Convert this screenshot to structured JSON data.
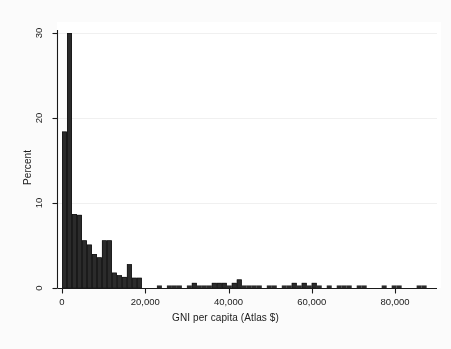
{
  "figure": {
    "background_color": "#fbfbfb",
    "plot_background_color": "#ffffff",
    "axis_color": "#1a1a1a",
    "bar_color": "#2b2b2b",
    "gridline_color": "#f0f0f0"
  },
  "chart_data": {
    "type": "bar",
    "title": "",
    "subtitle": "",
    "xlabel": "GNI per capita (Atlas $)",
    "ylabel": "Percent",
    "xlim": [
      -1500,
      88000
    ],
    "ylim": [
      0,
      30.5
    ],
    "xticks": [
      0,
      20000,
      40000,
      60000,
      80000
    ],
    "xtick_labels": [
      "0",
      "20,000",
      "40,000",
      "60,000",
      "80,000"
    ],
    "yticks": [
      0,
      10,
      20,
      30
    ],
    "ytick_labels": [
      "0",
      "10",
      "20",
      "30"
    ],
    "grid": "horizontal-faint",
    "legend": "none",
    "bin_width": 1200,
    "bin_starts": [
      0,
      1200,
      2400,
      3600,
      4800,
      6000,
      7200,
      8400,
      9600,
      10800,
      12000,
      13200,
      14400,
      15600,
      16800,
      18000,
      19200,
      20400,
      21600,
      22800,
      24000,
      25200,
      26400,
      27600,
      28800,
      30000,
      31200,
      32400,
      33600,
      34800,
      36000,
      37200,
      38400,
      39600,
      40800,
      42000,
      43200,
      44400,
      45600,
      46800,
      48000,
      49200,
      50400,
      51600,
      52800,
      54000,
      55200,
      56400,
      57600,
      58800,
      60000,
      61200,
      62400,
      63600,
      64800,
      66000,
      67200,
      68400,
      69600,
      70800,
      72000,
      73200,
      74400,
      75600,
      76800,
      78000,
      79200,
      80400,
      81600,
      82800,
      84000,
      85200,
      86400
    ],
    "values": [
      18.4,
      30.0,
      8.7,
      8.6,
      5.6,
      5.1,
      4.0,
      3.6,
      5.6,
      5.6,
      1.8,
      1.5,
      1.3,
      2.8,
      1.2,
      1.2,
      0.0,
      0.0,
      0.0,
      0.3,
      0.0,
      0.3,
      0.3,
      0.3,
      0.0,
      0.3,
      0.6,
      0.3,
      0.3,
      0.3,
      0.6,
      0.6,
      0.6,
      0.3,
      0.6,
      1.0,
      0.3,
      0.3,
      0.3,
      0.3,
      0.0,
      0.3,
      0.3,
      0.0,
      0.3,
      0.3,
      0.6,
      0.3,
      0.6,
      0.3,
      0.6,
      0.3,
      0.0,
      0.3,
      0.0,
      0.3,
      0.3,
      0.3,
      0.0,
      0.3,
      0.3,
      0.0,
      0.0,
      0.0,
      0.3,
      0.0,
      0.3,
      0.3,
      0.0,
      0.0,
      0.0,
      0.3,
      0.3
    ]
  }
}
